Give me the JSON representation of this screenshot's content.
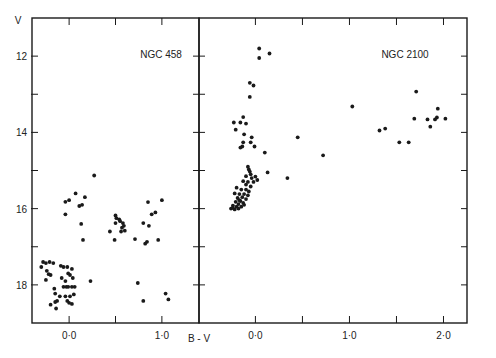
{
  "figure": {
    "y_axis_label": "V",
    "x_axis_label": "B - V",
    "ink_color": "#1a1a1a",
    "background": "#ffffff"
  },
  "chart_data": [
    {
      "type": "scatter",
      "title": "NGC 458",
      "xlabel": "B - V",
      "ylabel": "V",
      "xlim": [
        -0.4,
        1.4
      ],
      "ylim": [
        19,
        11
      ],
      "y_inverted": true,
      "x_ticks": [
        0.0,
        0.5,
        1.0
      ],
      "x_tick_labels": [
        "0·0",
        "",
        "1·0"
      ],
      "y_ticks": [
        12,
        13,
        14,
        15,
        16,
        17,
        18
      ],
      "y_tick_labels": [
        "12",
        "",
        "14",
        "",
        "16",
        "",
        "18"
      ],
      "grid": false,
      "points": [
        [
          0.27,
          15.13
        ],
        [
          0.07,
          15.6
        ],
        [
          0.0,
          15.78
        ],
        [
          -0.04,
          15.82
        ],
        [
          0.17,
          15.7
        ],
        [
          0.14,
          15.9
        ],
        [
          0.11,
          15.93
        ],
        [
          -0.04,
          16.15
        ],
        [
          0.13,
          16.4
        ],
        [
          0.15,
          16.82
        ],
        [
          0.23,
          17.9
        ],
        [
          1.0,
          15.78
        ],
        [
          0.85,
          15.83
        ],
        [
          0.93,
          16.1
        ],
        [
          0.89,
          16.15
        ],
        [
          0.8,
          16.38
        ],
        [
          0.86,
          16.45
        ],
        [
          0.96,
          16.82
        ],
        [
          0.71,
          16.8
        ],
        [
          0.84,
          16.87
        ],
        [
          0.82,
          16.92
        ],
        [
          0.74,
          17.95
        ],
        [
          0.8,
          18.42
        ],
        [
          1.04,
          18.23
        ],
        [
          1.07,
          18.38
        ],
        [
          0.5,
          16.18
        ],
        [
          0.51,
          16.25
        ],
        [
          0.54,
          16.28
        ],
        [
          0.5,
          16.38
        ],
        [
          0.55,
          16.33
        ],
        [
          0.58,
          16.38
        ],
        [
          0.59,
          16.45
        ],
        [
          0.57,
          16.5
        ],
        [
          0.6,
          16.58
        ],
        [
          0.56,
          16.6
        ],
        [
          0.44,
          16.6
        ],
        [
          0.49,
          16.82
        ],
        [
          -0.3,
          17.53
        ],
        [
          -0.28,
          17.4
        ],
        [
          -0.25,
          17.43
        ],
        [
          -0.21,
          17.4
        ],
        [
          -0.17,
          17.43
        ],
        [
          -0.24,
          17.63
        ],
        [
          -0.22,
          17.72
        ],
        [
          -0.2,
          17.74
        ],
        [
          -0.25,
          17.87
        ],
        [
          -0.09,
          17.5
        ],
        [
          -0.06,
          17.53
        ],
        [
          -0.02,
          17.53
        ],
        [
          0.03,
          17.58
        ],
        [
          -0.01,
          17.7
        ],
        [
          0.01,
          17.74
        ],
        [
          -0.08,
          17.82
        ],
        [
          0.04,
          17.82
        ],
        [
          -0.04,
          17.9
        ],
        [
          -0.06,
          18.05
        ],
        [
          -0.03,
          18.05
        ],
        [
          -0.01,
          18.05
        ],
        [
          0.03,
          18.05
        ],
        [
          0.06,
          18.05
        ],
        [
          -0.16,
          18.1
        ],
        [
          -0.15,
          18.23
        ],
        [
          -0.1,
          18.3
        ],
        [
          -0.04,
          18.3
        ],
        [
          0.01,
          18.3
        ],
        [
          0.05,
          18.25
        ],
        [
          -0.13,
          18.42
        ],
        [
          -0.15,
          18.45
        ],
        [
          -0.2,
          18.52
        ],
        [
          -0.02,
          18.42
        ],
        [
          0.0,
          18.47
        ],
        [
          0.03,
          18.5
        ],
        [
          -0.14,
          18.62
        ]
      ]
    },
    {
      "type": "scatter",
      "title": "NGC 2100",
      "xlabel": "B - V",
      "ylabel": "V",
      "xlim": [
        -0.6,
        2.25
      ],
      "ylim": [
        19,
        11
      ],
      "y_inverted": true,
      "x_ticks": [
        0.0,
        0.5,
        1.0,
        1.5,
        2.0
      ],
      "x_tick_labels": [
        "0·0",
        "",
        "1·0",
        "",
        "2·0"
      ],
      "y_ticks": [
        12,
        13,
        14,
        15,
        16,
        17,
        18
      ],
      "grid": false,
      "points": [
        [
          0.04,
          11.8
        ],
        [
          0.04,
          12.05
        ],
        [
          0.15,
          11.93
        ],
        [
          -0.06,
          12.7
        ],
        [
          -0.02,
          12.77
        ],
        [
          -0.06,
          13.07
        ],
        [
          -0.13,
          13.6
        ],
        [
          -0.23,
          13.74
        ],
        [
          -0.16,
          13.74
        ],
        [
          -0.1,
          13.77
        ],
        [
          -0.21,
          13.93
        ],
        [
          -0.12,
          14.05
        ],
        [
          -0.04,
          14.13
        ],
        [
          -0.05,
          14.26
        ],
        [
          -0.13,
          14.26
        ],
        [
          -0.14,
          14.37
        ],
        [
          -0.16,
          14.4
        ],
        [
          -0.01,
          14.37
        ],
        [
          0.1,
          14.53
        ],
        [
          0.45,
          14.13
        ],
        [
          0.72,
          14.6
        ],
        [
          0.13,
          15.05
        ],
        [
          0.34,
          15.2
        ],
        [
          -0.08,
          14.9
        ],
        [
          -0.07,
          14.97
        ],
        [
          -0.06,
          15.03
        ],
        [
          -0.05,
          15.1
        ],
        [
          -0.1,
          15.15
        ],
        [
          -0.04,
          15.2
        ],
        [
          0.0,
          15.16
        ],
        [
          -0.13,
          15.28
        ],
        [
          -0.08,
          15.3
        ],
        [
          -0.02,
          15.3
        ],
        [
          -0.1,
          15.37
        ],
        [
          -0.05,
          15.42
        ],
        [
          0.02,
          15.25
        ],
        [
          -0.2,
          15.45
        ],
        [
          -0.15,
          15.5
        ],
        [
          -0.1,
          15.5
        ],
        [
          -0.07,
          15.55
        ],
        [
          -0.22,
          15.6
        ],
        [
          -0.17,
          15.62
        ],
        [
          -0.12,
          15.62
        ],
        [
          -0.08,
          15.65
        ],
        [
          -0.14,
          15.7
        ],
        [
          -0.19,
          15.72
        ],
        [
          -0.1,
          15.75
        ],
        [
          -0.16,
          15.8
        ],
        [
          -0.21,
          15.82
        ],
        [
          -0.13,
          15.85
        ],
        [
          -0.18,
          15.88
        ],
        [
          -0.24,
          15.92
        ],
        [
          -0.2,
          15.95
        ],
        [
          -0.15,
          15.95
        ],
        [
          -0.26,
          16.0
        ],
        [
          -0.22,
          16.02
        ],
        [
          -0.18,
          16.0
        ],
        [
          -0.24,
          15.98
        ],
        [
          -0.12,
          15.9
        ],
        [
          -0.17,
          15.78
        ],
        [
          1.71,
          12.93
        ],
        [
          1.03,
          13.32
        ],
        [
          1.94,
          13.38
        ],
        [
          1.69,
          13.64
        ],
        [
          1.83,
          13.66
        ],
        [
          1.93,
          13.61
        ],
        [
          1.91,
          13.66
        ],
        [
          2.02,
          13.64
        ],
        [
          1.86,
          13.85
        ],
        [
          1.32,
          13.95
        ],
        [
          1.38,
          13.9
        ],
        [
          1.53,
          14.26
        ],
        [
          1.63,
          14.26
        ]
      ]
    }
  ]
}
